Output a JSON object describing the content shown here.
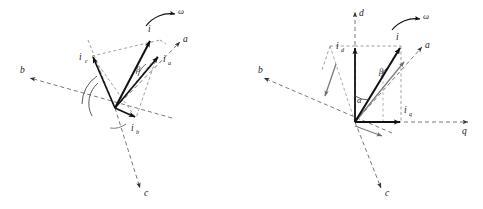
{
  "figure": {
    "background": "#ffffff",
    "stroke_solid": "#111111",
    "stroke_dashed": "#555555",
    "panels": [
      {
        "id": "left-panel",
        "name": "three-phase-abc-phasor-diagram",
        "axes": [
          {
            "name": "axis-a",
            "label": "a"
          },
          {
            "name": "axis-b",
            "label": "b"
          },
          {
            "name": "axis-c",
            "label": "c"
          }
        ],
        "vectors": [
          {
            "name": "vector-ia",
            "label": "i",
            "sub": "a"
          },
          {
            "name": "vector-ib",
            "label": "i",
            "sub": "b"
          },
          {
            "name": "vector-ic",
            "label": "i",
            "sub": "c"
          },
          {
            "name": "vector-i-resultant",
            "label": "i",
            "sub": ""
          }
        ],
        "angles": [
          {
            "name": "angle-beta",
            "label": "β"
          }
        ],
        "rotation": {
          "name": "omega-rotation",
          "label": "ω"
        }
      },
      {
        "id": "right-panel",
        "name": "dq-axis-phasor-diagram",
        "axes": [
          {
            "name": "axis-d",
            "label": "d"
          },
          {
            "name": "axis-q",
            "label": "q"
          },
          {
            "name": "axis-a",
            "label": "a"
          },
          {
            "name": "axis-b",
            "label": "b"
          },
          {
            "name": "axis-c",
            "label": "c"
          }
        ],
        "vectors": [
          {
            "name": "vector-id",
            "label": "i",
            "sub": "d"
          },
          {
            "name": "vector-iq",
            "label": "i",
            "sub": "q"
          },
          {
            "name": "vector-i-resultant",
            "label": "i",
            "sub": ""
          }
        ],
        "angles": [
          {
            "name": "angle-alpha",
            "label": "α"
          },
          {
            "name": "angle-beta",
            "label": "β"
          }
        ],
        "rotation": {
          "name": "omega-rotation",
          "label": "ω"
        }
      }
    ]
  }
}
